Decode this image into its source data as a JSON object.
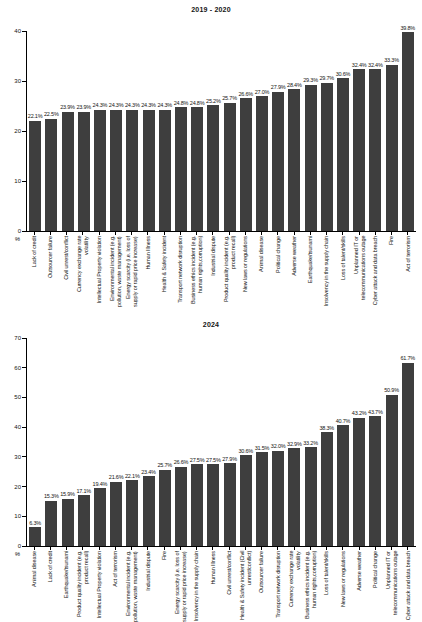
{
  "page": {
    "background": "#ffffff"
  },
  "colors": {
    "bar": "#3e3e3e",
    "axis": "#000000",
    "text": "#141414"
  },
  "chart_data": [
    {
      "type": "bar",
      "title": "2019 - 2020",
      "xlabel": "",
      "ylabel": "%",
      "ylim": [
        0,
        40
      ],
      "yticks": [
        0,
        10,
        20,
        30,
        40
      ],
      "grid": false,
      "legend": false,
      "categories": [
        "Lack of credit",
        "Outsourcer failure",
        "Civil unrest/conflict",
        "Currency exchange rate volatility",
        "Intellectual Property violation",
        "Environmental incident (e.g. pollution, waste management)",
        "Energy scarcity (i.e. loss of supply or rapid price increase)",
        "Human Illness",
        "Health & Safety incident",
        "Transport network disruption",
        "Business ethics incident (e.g. human rights,corruption)",
        "Industrial dispute",
        "Product quality incident (e.g. product recall)",
        "New laws or regulations",
        "Animal disease",
        "Political change",
        "Adverse weather",
        "Earthquake/tsunami",
        "Insolvency in the supply chain",
        "Loss of talent/skills",
        "Unplanned IT or telecommunications outage",
        "Cyber attack and data breach",
        "Fire",
        "Act of terrorism"
      ],
      "values": [
        22.1,
        22.5,
        23.9,
        23.9,
        24.3,
        24.3,
        24.3,
        24.3,
        24.3,
        24.8,
        24.8,
        25.2,
        25.7,
        26.6,
        27.0,
        27.9,
        28.4,
        29.3,
        29.7,
        30.6,
        32.4,
        32.4,
        33.3,
        39.8
      ],
      "value_labels": [
        "22.1%",
        "22.5%",
        "23.9%",
        "23.9%",
        "24.3%",
        "24.3%",
        "24.3%",
        "24.3%",
        "24.3%",
        "24.8%",
        "24.8%",
        "25.2%",
        "25.7%",
        "26.6%",
        "27.0%",
        "27.9%",
        "28.4%",
        "29.3%",
        "29.7%",
        "30.6%",
        "32.4%",
        "32.4%",
        "33.3%",
        "39.8%"
      ]
    },
    {
      "type": "bar",
      "title": "2024",
      "xlabel": "",
      "ylabel": "%",
      "ylim": [
        0,
        70
      ],
      "yticks": [
        0,
        10,
        20,
        30,
        40,
        50,
        60,
        70
      ],
      "grid": false,
      "legend": false,
      "categories": [
        "Animal disease",
        "Lack of credit",
        "Earthquake/tsunami",
        "Product quality incident (e.g. product recall)",
        "Intellectual Property violation",
        "Act of terrorism",
        "Environmental incident (e.g. pollution, waste management)",
        "Industrial dispute",
        "Fire",
        "Energy scarcity (i.e. loss of supply or rapid price increase)",
        "Insolvency in the supply chain",
        "Human Illness",
        "Civil unrest/conflict",
        "Health & Safety incident (Civil unrest/conflict)",
        "Outsourcer failure",
        "Transport network disruption",
        "Currency exchange rate volatility",
        "Business ethics incident (e.g. human rights,corruption)",
        "Loss of talent/skills",
        "New laws or regulations",
        "Adverse weather",
        "Political change",
        "Unplanned IT or telecommunications outage",
        "Cyber attack and data breach"
      ],
      "values": [
        6.3,
        15.3,
        15.9,
        17.1,
        19.4,
        21.6,
        22.1,
        23.4,
        25.7,
        26.6,
        27.5,
        27.5,
        27.9,
        30.6,
        31.5,
        32.0,
        32.9,
        33.2,
        38.3,
        40.7,
        43.2,
        43.7,
        50.9,
        61.7
      ],
      "value_labels": [
        "6.3%",
        "15.3%",
        "15.9%",
        "17.1%",
        "19.4%",
        "21.6%",
        "22.1%",
        "23.4%",
        "25.7%",
        "26.6%",
        "27.5%",
        "27.5%",
        "27.9%",
        "30.6%",
        "31.5%",
        "32.0%",
        "32.9%",
        "33.2%",
        "38.3%",
        "40.7%",
        "43.2%",
        "43.7%",
        "50.9%",
        "61.7%"
      ]
    }
  ]
}
